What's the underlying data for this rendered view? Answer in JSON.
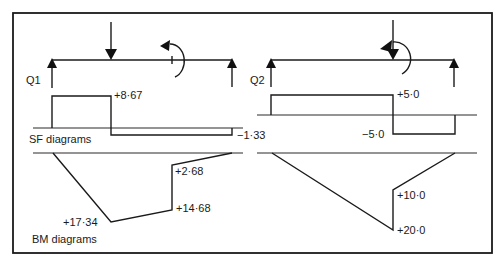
{
  "left_panel": {
    "reaction_label": "Q1",
    "sf_values": {
      "positive": "+8·67",
      "negative": "−1·33"
    },
    "bm_values": {
      "peak": "+17·34",
      "before_moment": "+14·68",
      "after_moment": "+2·68"
    },
    "sf_caption": "SF diagrams",
    "bm_caption": "BM diagrams"
  },
  "right_panel": {
    "reaction_label": "Q2",
    "sf_values": {
      "positive": "+5·0",
      "negative": "−5·0"
    },
    "bm_values": {
      "lower": "+10·0",
      "peak": "+20·0"
    }
  },
  "icons": {
    "point_load": "down-arrow",
    "applied_moment": "curved-arrow-anticlockwise",
    "reaction": "up-arrow"
  }
}
